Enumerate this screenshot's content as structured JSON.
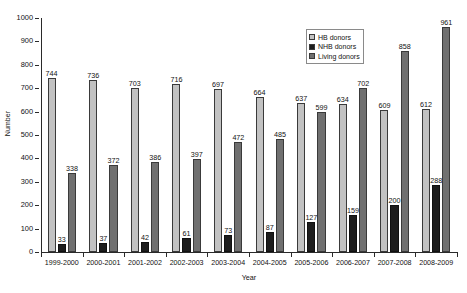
{
  "chart_data": {
    "type": "bar",
    "title": "",
    "xlabel": "Year",
    "ylabel": "Number",
    "ylim": [
      0,
      1000
    ],
    "ytick_step": 100,
    "yticks": [
      0,
      100,
      200,
      300,
      400,
      500,
      600,
      700,
      800,
      900,
      1000
    ],
    "grid": false,
    "legend_position": "top-right",
    "categories": [
      "1999-2000",
      "2000-2001",
      "2001-2002",
      "2002-2003",
      "2003-2004",
      "2004-2005",
      "2005-2006",
      "2006-2007",
      "2007-2008",
      "2008-2009"
    ],
    "series": [
      {
        "name": "HB donors",
        "color": "#c2c2c2",
        "values": [
          744,
          736,
          703,
          716,
          697,
          664,
          637,
          634,
          609,
          612
        ]
      },
      {
        "name": "NHB donors",
        "color": "#1d1d1d",
        "values": [
          33,
          37,
          42,
          61,
          73,
          87,
          127,
          159,
          200,
          288
        ]
      },
      {
        "name": "Living donors",
        "color": "#707070",
        "values": [
          338,
          372,
          386,
          397,
          472,
          485,
          599,
          702,
          858,
          961
        ]
      }
    ]
  }
}
